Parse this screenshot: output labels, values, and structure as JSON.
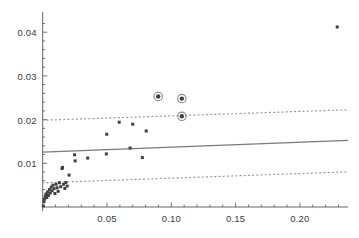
{
  "chart_data": {
    "type": "scatter",
    "title": "",
    "subtitle": "",
    "xlabel": "",
    "ylabel": "",
    "xlim": [
      -0.004,
      0.2375
    ],
    "ylim": [
      -0.0012,
      0.0437
    ],
    "grid": false,
    "legend": false,
    "legend_position": "none",
    "xticks": [
      0.05,
      0.1,
      0.15,
      0.2
    ],
    "xtick_labels": [
      "0.05",
      "0.10",
      "0.15",
      "0.20"
    ],
    "yticks": [
      0.01,
      0.02,
      0.03,
      0.04
    ],
    "ytick_labels": [
      "0.01",
      "0.02",
      "0.03",
      "0.04"
    ],
    "x_minor_tick_count": 4,
    "y_minor_tick_count": 4,
    "marker_color": "#404040",
    "highlight_ring_color": "#8a8a8a",
    "fit_line_color": "#7a7a7a",
    "band_line_color": "#9a9a9a",
    "axis_color": "#555555",
    "series": [
      {
        "name": "points",
        "marker": "square-small",
        "points": [
          [
            0.0005,
            0.00025
          ],
          [
            0.001,
            0.0012
          ],
          [
            0.0014,
            0.0018
          ],
          [
            0.002,
            0.00245
          ],
          [
            0.0026,
            0.003
          ],
          [
            0.0032,
            0.00215
          ],
          [
            0.0038,
            0.00345
          ],
          [
            0.0045,
            0.00265
          ],
          [
            0.0052,
            0.004
          ],
          [
            0.0058,
            0.0032
          ],
          [
            0.0066,
            0.00455
          ],
          [
            0.0072,
            0.0037
          ],
          [
            0.008,
            0.005
          ],
          [
            0.0088,
            0.0042
          ],
          [
            0.0095,
            0.0031
          ],
          [
            0.0104,
            0.0052
          ],
          [
            0.0112,
            0.0044
          ],
          [
            0.012,
            0.0036
          ],
          [
            0.013,
            0.00555
          ],
          [
            0.014,
            0.00465
          ],
          [
            0.015,
            0.0088
          ],
          [
            0.0154,
            0.00905
          ],
          [
            0.0162,
            0.0052
          ],
          [
            0.0172,
            0.00425
          ],
          [
            0.018,
            0.0056
          ],
          [
            0.019,
            0.0048
          ],
          [
            0.0205,
            0.0073
          ],
          [
            0.0248,
            0.01195
          ],
          [
            0.0252,
            0.01055
          ],
          [
            0.035,
            0.0112
          ],
          [
            0.0495,
            0.01215
          ],
          [
            0.0498,
            0.01665
          ],
          [
            0.0595,
            0.0194
          ],
          [
            0.068,
            0.0135
          ],
          [
            0.07,
            0.01895
          ],
          [
            0.0775,
            0.0113
          ],
          [
            0.0805,
            0.0174
          ],
          [
            0.229,
            0.0412
          ]
        ]
      },
      {
        "name": "highlighted-points",
        "marker": "circle-ringed",
        "points": [
          [
            0.0898,
            0.0253
          ],
          [
            0.1082,
            0.0248
          ],
          [
            0.1082,
            0.02075
          ]
        ]
      }
    ],
    "lines": [
      {
        "name": "fit-line",
        "style": "solid",
        "x": [
          0.0,
          0.2375
        ],
        "y": [
          0.01255,
          0.01525
        ]
      },
      {
        "name": "upper-confidence-band",
        "style": "dotted",
        "x": [
          0.0,
          0.2375
        ],
        "y": [
          0.01985,
          0.02225
        ]
      },
      {
        "name": "lower-confidence-band",
        "style": "dotted",
        "x": [
          0.0,
          0.2375
        ],
        "y": [
          0.00555,
          0.00805
        ]
      }
    ]
  }
}
